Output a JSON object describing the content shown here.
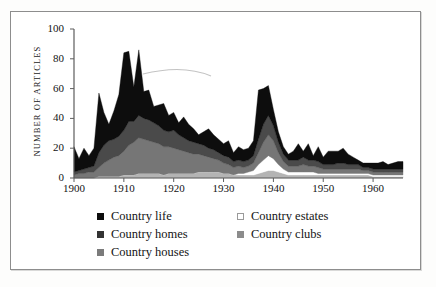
{
  "chart_data": {
    "type": "area",
    "stacked": true,
    "title": "",
    "subtitle": "",
    "xlabel": "",
    "ylabel": "NUMBER OF ARTICLES",
    "xlim": [
      1900,
      1966
    ],
    "ylim": [
      0,
      100
    ],
    "grid": false,
    "legend_position": "below-plot",
    "y_ticks": [
      "0",
      "20",
      "40",
      "60",
      "80",
      "100"
    ],
    "y_tick_values": [
      0,
      20,
      40,
      60,
      80,
      100
    ],
    "x_ticks": [
      "1900",
      "1910",
      "1920",
      "1930",
      "1940",
      "1950",
      "1960"
    ],
    "x_tick_values": [
      1900,
      1910,
      1920,
      1930,
      1940,
      1950,
      1960
    ],
    "x": [
      1900,
      1901,
      1902,
      1903,
      1904,
      1905,
      1906,
      1907,
      1908,
      1909,
      1910,
      1911,
      1912,
      1913,
      1914,
      1915,
      1916,
      1917,
      1918,
      1919,
      1920,
      1921,
      1922,
      1923,
      1924,
      1925,
      1926,
      1927,
      1928,
      1929,
      1930,
      1931,
      1932,
      1933,
      1934,
      1935,
      1936,
      1937,
      1938,
      1939,
      1940,
      1941,
      1942,
      1943,
      1944,
      1945,
      1946,
      1947,
      1948,
      1949,
      1950,
      1951,
      1952,
      1953,
      1954,
      1955,
      1956,
      1957,
      1958,
      1959,
      1960,
      1961,
      1962,
      1963,
      1964,
      1965,
      1966
    ],
    "series": [
      {
        "name": "Country clubs",
        "color": "#b4b4b4",
        "values": [
          0,
          0,
          0,
          0,
          0,
          1,
          1,
          1,
          1,
          1,
          2,
          2,
          2,
          3,
          3,
          3,
          3,
          3,
          2,
          3,
          3,
          3,
          3,
          3,
          3,
          4,
          4,
          4,
          4,
          4,
          3,
          3,
          2,
          2,
          2,
          2,
          2,
          3,
          4,
          5,
          5,
          4,
          3,
          2,
          2,
          2,
          2,
          2,
          2,
          2,
          2,
          2,
          2,
          2,
          2,
          2,
          2,
          2,
          2,
          2,
          1,
          1,
          1,
          1,
          1,
          1,
          1
        ]
      },
      {
        "name": "Country estates",
        "color": "#ffffff",
        "values": [
          0,
          0,
          0,
          0,
          0,
          0,
          0,
          0,
          0,
          0,
          0,
          0,
          0,
          0,
          0,
          0,
          0,
          0,
          0,
          0,
          0,
          0,
          0,
          0,
          0,
          0,
          0,
          0,
          0,
          0,
          0,
          0,
          0,
          1,
          1,
          2,
          3,
          6,
          8,
          10,
          8,
          5,
          3,
          2,
          2,
          2,
          2,
          2,
          2,
          1,
          1,
          1,
          1,
          1,
          1,
          1,
          1,
          1,
          1,
          1,
          1,
          1,
          1,
          1,
          1,
          1,
          1
        ]
      },
      {
        "name": "Country houses",
        "color": "#767676",
        "values": [
          2,
          3,
          3,
          4,
          4,
          6,
          9,
          11,
          13,
          14,
          16,
          20,
          22,
          24,
          23,
          22,
          21,
          20,
          19,
          18,
          17,
          16,
          15,
          14,
          13,
          12,
          11,
          10,
          9,
          8,
          7,
          6,
          5,
          5,
          4,
          4,
          5,
          8,
          12,
          14,
          12,
          8,
          5,
          4,
          4,
          4,
          5,
          4,
          4,
          4,
          3,
          3,
          3,
          3,
          3,
          3,
          3,
          3,
          2,
          2,
          2,
          2,
          2,
          2,
          2,
          2,
          2
        ]
      },
      {
        "name": "Country homes",
        "color": "#4a4a4a",
        "values": [
          2,
          2,
          3,
          3,
          4,
          10,
          12,
          13,
          12,
          13,
          14,
          16,
          14,
          15,
          14,
          14,
          13,
          12,
          11,
          10,
          12,
          10,
          9,
          8,
          8,
          7,
          7,
          6,
          6,
          5,
          5,
          5,
          4,
          4,
          4,
          4,
          5,
          9,
          12,
          13,
          10,
          7,
          5,
          4,
          4,
          4,
          5,
          4,
          4,
          4,
          3,
          3,
          3,
          4,
          4,
          3,
          3,
          3,
          2,
          2,
          2,
          2,
          2,
          2,
          2,
          2,
          2
        ]
      },
      {
        "name": "Country life",
        "color": "#0d0d0d",
        "values": [
          17,
          8,
          14,
          8,
          12,
          40,
          22,
          11,
          19,
          28,
          52,
          47,
          23,
          44,
          18,
          20,
          11,
          14,
          18,
          11,
          12,
          8,
          14,
          11,
          9,
          6,
          9,
          13,
          10,
          9,
          8,
          11,
          6,
          9,
          8,
          8,
          10,
          33,
          24,
          20,
          11,
          7,
          5,
          4,
          6,
          11,
          4,
          11,
          3,
          10,
          5,
          9,
          9,
          8,
          10,
          7,
          5,
          3,
          3,
          3,
          4,
          4,
          5,
          3,
          4,
          5,
          5
        ]
      }
    ],
    "legend": [
      {
        "label": "Country life",
        "color": "#0d0d0d",
        "border": "#0d0d0d",
        "column": "left"
      },
      {
        "label": "Country homes",
        "color": "#333333",
        "border": "#333333",
        "column": "left"
      },
      {
        "label": "Country houses",
        "color": "#7b7b7b",
        "border": "#7b7b7b",
        "column": "left"
      },
      {
        "label": "Country estates",
        "color": "#ffffff",
        "border": "#9a9a9a",
        "column": "right"
      },
      {
        "label": "Country clubs",
        "color": "#8c8c8c",
        "border": "#8c8c8c",
        "column": "right"
      }
    ],
    "axis_color": "#5d5d5d",
    "frame_color": "#8d8d8d"
  }
}
